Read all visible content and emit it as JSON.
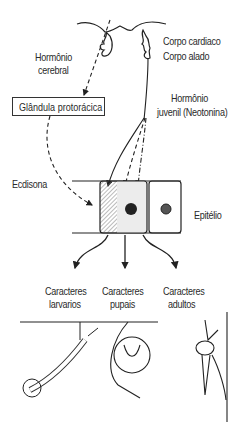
{
  "diagram": {
    "labels": {
      "brain_hormone": [
        "Hormônio",
        "cerebral"
      ],
      "corpora": [
        "Corpo cardiaco",
        "Corpo alado"
      ],
      "juvenile_hormone": [
        "Hormônio",
        "juvenil (Neotonina)"
      ],
      "gland": "Glândula protorácica",
      "ecdysone": "Ecdisona",
      "epithelium": "Epitélio",
      "larval": [
        "Caracteres",
        "larvarios"
      ],
      "pupal": [
        "Caracteres",
        "pupais"
      ],
      "adult": [
        "Caracteres",
        "adultos"
      ]
    },
    "illustrations": [
      "mosquito-larva",
      "mosquito-pupa",
      "adult-mosquito"
    ]
  }
}
